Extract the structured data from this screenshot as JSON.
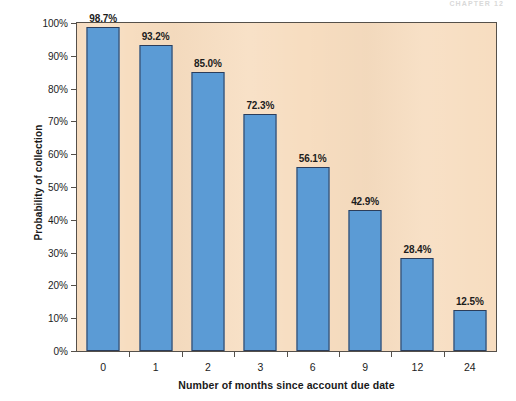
{
  "page": {
    "running_head": "CHAPTER 12"
  },
  "chart_data": {
    "type": "bar",
    "title": "",
    "subtitle": "",
    "categories": [
      "0",
      "1",
      "2",
      "3",
      "6",
      "9",
      "12",
      "24"
    ],
    "values": [
      98.7,
      93.2,
      85.0,
      72.3,
      56.1,
      42.9,
      28.4,
      12.5
    ],
    "data_labels": [
      "98.7%",
      "93.2%",
      "85.0%",
      "72.3%",
      "56.1%",
      "42.9%",
      "28.4%",
      "12.5%"
    ],
    "xlabel": "Number of months since account due date",
    "ylabel": "Probability of collection",
    "ylim": [
      0,
      100
    ],
    "ytick_values": [
      0,
      10,
      20,
      30,
      40,
      50,
      60,
      70,
      80,
      90,
      100
    ],
    "ytick_labels": [
      "0%",
      "10%",
      "20%",
      "30%",
      "40%",
      "50%",
      "60%",
      "70%",
      "80%",
      "90%",
      "100%"
    ],
    "grid": false,
    "legend": false,
    "legend_position": "none",
    "colors": {
      "bar_fill": "#5b9bd5",
      "bar_edge": "#2c3d5a",
      "plot_background": "#f7ddc0",
      "axis_line": "#55504a",
      "text": "#1c1c1c",
      "page_background": "#ffffff"
    }
  }
}
